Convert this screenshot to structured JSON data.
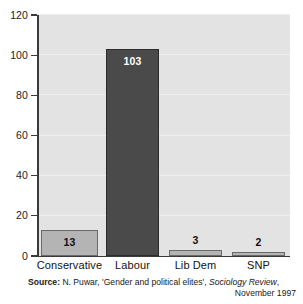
{
  "chart_data": {
    "type": "bar",
    "title": "",
    "subtitle": "",
    "xlabel": "",
    "ylabel": "",
    "categories": [
      "Conservative",
      "Labour",
      "Lib Dem",
      "SNP"
    ],
    "values": [
      13,
      103,
      3,
      2
    ],
    "series": [
      {
        "name": "Number of women MPs",
        "values": [
          13,
          103,
          3,
          2
        ]
      }
    ],
    "data_labels": [
      "13",
      "103",
      "3",
      "2"
    ],
    "ylim": [
      0,
      120
    ],
    "yticks": [
      0,
      20,
      40,
      60,
      80,
      100,
      120
    ],
    "ytick_labels": [
      "0",
      "20",
      "40",
      "60",
      "80",
      "100",
      "120"
    ],
    "grid": "horizontal",
    "legend": "none",
    "bar_colors": [
      "#b4b4b4",
      "#4a4a4a",
      "#b4b4b4",
      "#b4b4b4"
    ],
    "plot_background": "#e3e3e3",
    "axis_color": "#3a3a3a"
  },
  "source": {
    "label": "Source:",
    "line1_text": " N. Puwar, 'Gender and political elites', ",
    "publication": "Sociology Review",
    "line1_tail": ",",
    "line2": "November 1997"
  }
}
